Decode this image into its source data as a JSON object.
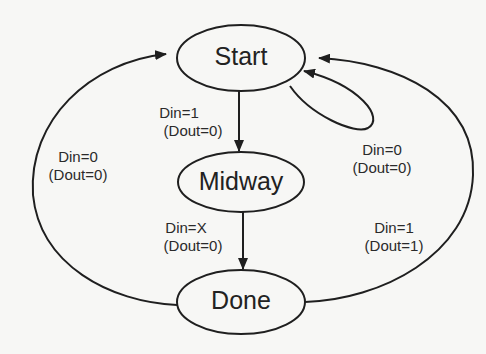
{
  "diagram": {
    "type": "state-machine",
    "states": [
      {
        "id": "start",
        "label": "Start"
      },
      {
        "id": "midway",
        "label": "Midway"
      },
      {
        "id": "done",
        "label": "Done"
      }
    ],
    "transitions": [
      {
        "from": "start",
        "to": "midway",
        "condition": "Din=1",
        "output": "(Dout=0)"
      },
      {
        "from": "start",
        "to": "start",
        "condition": "Din=0",
        "output": "(Dout=0)"
      },
      {
        "from": "midway",
        "to": "done",
        "condition": "Din=X",
        "output": "(Dout=0)"
      },
      {
        "from": "done",
        "to": "start",
        "condition": "Din=0",
        "output": "(Dout=0)",
        "side": "left"
      },
      {
        "from": "done",
        "to": "start",
        "condition": "Din=1",
        "output": "(Dout=1)",
        "side": "right"
      }
    ]
  },
  "colors": {
    "stroke": "#1f1f1f",
    "background": "#f7f7f5",
    "text": "#2a2a2a"
  }
}
